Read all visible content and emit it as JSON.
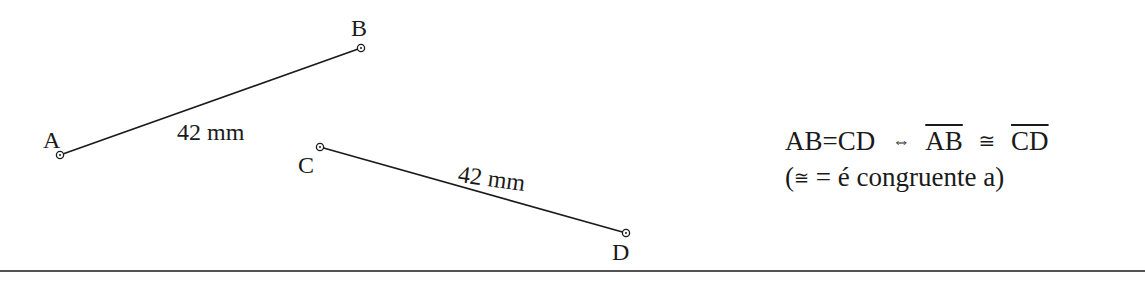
{
  "diagram": {
    "segments": [
      {
        "name": "AB",
        "start": {
          "label": "A",
          "x": 60,
          "y": 155
        },
        "end": {
          "label": "B",
          "x": 361,
          "y": 48
        },
        "length_label": "42 mm"
      },
      {
        "name": "CD",
        "start": {
          "label": "C",
          "x": 320,
          "y": 147
        },
        "end": {
          "label": "D",
          "x": 626,
          "y": 233
        },
        "length_label": "42 mm"
      }
    ],
    "points": {
      "A": "A",
      "B": "B",
      "C": "C",
      "D": "D"
    },
    "formula": {
      "lhs_left": "AB",
      "lhs_eq": "=",
      "lhs_right": "CD",
      "iff": "⇔",
      "seg1": "AB",
      "cong": "≅",
      "seg2": "CD",
      "note_open": "(",
      "note_cong": "≅",
      "note_text": " = é congruente a)"
    },
    "colors": {
      "stroke": "#1a1a1a",
      "background": "#ffffff",
      "rule": "#555555"
    }
  }
}
